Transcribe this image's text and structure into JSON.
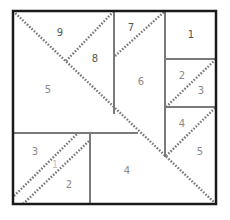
{
  "diagram": {
    "colors": {
      "outer_border": "#1a1a1a",
      "inner_lines": "#7a7a7a",
      "dotted_seams": "#7a7a7a",
      "label": "#8a8a8a",
      "background": "#ffffff"
    },
    "labels": {
      "l9": "9",
      "l8": "8",
      "l7": "7",
      "l1": "1",
      "l5a": "5",
      "l6": "6",
      "l2a": "2",
      "l3a": "3",
      "l4a": "4",
      "l5b": "5",
      "l3b": "3",
      "l1b": "1",
      "l2b": "2",
      "l4b": "4"
    }
  }
}
